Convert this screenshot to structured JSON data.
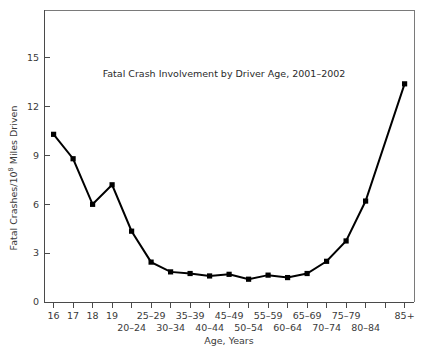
{
  "chart_data": {
    "type": "line",
    "title": "Fatal Crash Involvement by Driver Age, 2001–2002",
    "xlabel": "Age, Years",
    "ylabel": "Fatal Crashes/10⁸ Miles Driven",
    "ylabel_main": "Fatal Crashes/10",
    "ylabel_exponent": "8",
    "ylabel_tail": " Miles Driven",
    "categories": [
      "16",
      "17",
      "18",
      "19",
      "20–24",
      "25–29",
      "30–34",
      "35–39",
      "40–44",
      "45–49",
      "50–54",
      "55–59",
      "60–64",
      "65–69",
      "70–74",
      "75–79",
      "80–84",
      "85+"
    ],
    "values": [
      10.3,
      8.8,
      6.0,
      7.2,
      4.35,
      2.45,
      1.85,
      1.75,
      1.6,
      1.7,
      1.4,
      1.65,
      1.5,
      1.75,
      2.5,
      3.75,
      6.2,
      13.4
    ],
    "xtick_labels": [
      "16",
      "17",
      "18",
      "19",
      "20–24",
      "25–29",
      "30–34",
      "35–39",
      "40–44",
      "45–49",
      "50–54",
      "55–59",
      "60–64",
      "65–69",
      "70–74",
      "75–79",
      "80–84",
      "85+"
    ],
    "ytick_labels": [
      "0",
      "3",
      "6",
      "9",
      "12",
      "15"
    ],
    "ytick_values": [
      0,
      3,
      6,
      9,
      12,
      15
    ],
    "ylim": [
      0,
      17.4
    ],
    "grid": false,
    "legend": "none",
    "marker": "square",
    "series_color": "#000000",
    "background_color": "#ffffff"
  },
  "figure": {
    "frame_color": "#7a7a7a",
    "axis_color": "#4a4a4a",
    "text_color": "#3a3a3a"
  }
}
